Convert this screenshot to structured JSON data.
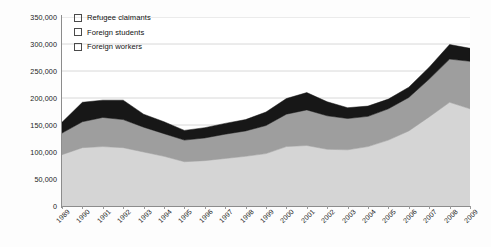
{
  "chart_data": {
    "type": "area",
    "title": "",
    "subtitle": "",
    "xlabel": "",
    "ylabel": "",
    "stacked": true,
    "grid": true,
    "legend_position": "top-left",
    "ylim": [
      0,
      350000
    ],
    "ytick_labels": [
      "350,000",
      "300,000",
      "250,000",
      "200,000",
      "150,000",
      "100,000",
      "50,000",
      "0"
    ],
    "ytick_values": [
      350000,
      300000,
      250000,
      200000,
      150000,
      100000,
      50000,
      0
    ],
    "categories": [
      "1989",
      "1990",
      "1991",
      "1992",
      "1993",
      "1994",
      "1995",
      "1996",
      "1997",
      "1998",
      "1999",
      "2000",
      "2001",
      "2002",
      "2003",
      "2004",
      "2005",
      "2006",
      "2007",
      "2008",
      "2009"
    ],
    "series": [
      {
        "name": "Foreign workers",
        "color": "#d5d5d5",
        "values": [
          95000,
          108000,
          110000,
          108000,
          100000,
          92000,
          82000,
          84000,
          88000,
          92000,
          97000,
          110000,
          112000,
          105000,
          104000,
          110000,
          122000,
          139000,
          165000,
          192000,
          180000
        ]
      },
      {
        "name": "Foreign students",
        "color": "#9e9e9e",
        "values": [
          40000,
          48000,
          54000,
          52000,
          46000,
          42000,
          40000,
          42000,
          45000,
          47000,
          52000,
          60000,
          66000,
          62000,
          58000,
          56000,
          58000,
          62000,
          70000,
          80000,
          88000
        ]
      },
      {
        "name": "Refugee claimants",
        "color": "#171717",
        "values": [
          20000,
          36000,
          32000,
          36000,
          24000,
          22000,
          18000,
          19000,
          20000,
          21000,
          25000,
          29000,
          32000,
          26000,
          20000,
          19000,
          18000,
          19000,
          22000,
          27000,
          24000
        ]
      }
    ],
    "totals": [
      155000,
      192000,
      196000,
      196000,
      170000,
      156000,
      140000,
      145000,
      153000,
      160000,
      174000,
      199000,
      210000,
      193000,
      182000,
      185000,
      198000,
      220000,
      257000,
      299000,
      292000
    ]
  },
  "legend": {
    "items": [
      {
        "label": "Refugee claimants",
        "swatch": "black-swatch"
      },
      {
        "label": "Foreign students",
        "swatch": "gray-swatch"
      },
      {
        "label": "Foreign workers",
        "swatch": "light-gray-swatch"
      }
    ]
  },
  "colors": {
    "refugee_claimants": "#171717",
    "foreign_students": "#9e9e9e",
    "foreign_workers": "#d5d5d5",
    "gridline": "#d8d8d8",
    "axis": "#8c8c8c",
    "text": "#1a1a1a",
    "plot_background": "#ffffff",
    "page_background": "#fdfdfd"
  }
}
